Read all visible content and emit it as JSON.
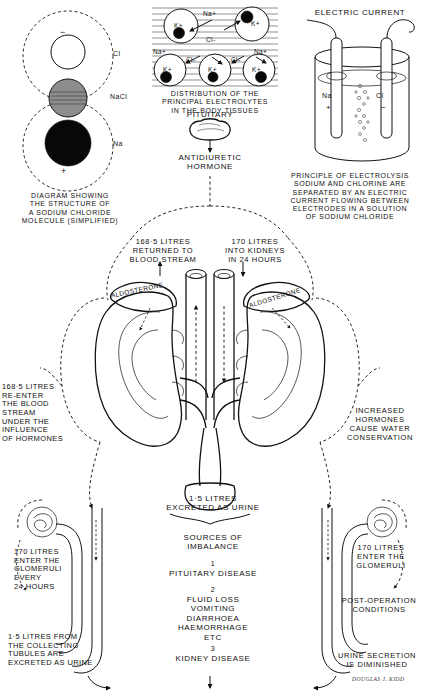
{
  "panels": {
    "molecule": {
      "title": "DIAGRAM SHOWING\nTHE STRUCTURE OF\nA SODIUM CHLORIDE\nMOLECULE (SIMPLIFIED)",
      "minus_sign": "−",
      "plus_sign": "+",
      "label_cl": "Cl",
      "label_nacl": "NaCl",
      "label_na": "Na"
    },
    "electrolytes": {
      "title": "DISTRIBUTION OF THE\nPRINCIPAL ELECTROLYTES\nIN THE BODY TISSUES",
      "ions": {
        "potassium": "K+",
        "sodium": "Na+",
        "chloride": "Cl-"
      },
      "cell_labels": [
        "K+",
        "K+",
        "K+",
        "K+",
        "K+"
      ],
      "free_sodium": [
        "Na+",
        "Na+",
        "Na+"
      ],
      "free_chloride": [
        "Cl-",
        "Cl-",
        "Cl-"
      ]
    },
    "electrolysis": {
      "heading": "ELECTRIC CURRENT",
      "anode_label": "Na",
      "anode_sign": "+",
      "cathode_label": "Cl",
      "cathode_sign": "−",
      "caption": "PRINCIPLE OF ELECTROLYSIS\nSODIUM AND CHLORINE ARE\nSEPARATED BY AN ELECTRIC\nCURRENT FLOWING BETWEEN\nELECTRODES IN A SOLUTION\nOF SODIUM CHLORIDE"
    }
  },
  "pituitary": {
    "gland_label": "PITUITARY",
    "hormone_label": "ANTIDIURETIC\nHORMONE"
  },
  "kidneys": {
    "returned_label": "168·5 LITRES\nRETURNED TO\nBLOOD STREAM",
    "intake_label": "170 LITRES\nINTO KIDNEYS\nIN 24 HOURS",
    "adrenal_left": "ALDOSTERONE",
    "adrenal_right": "ALDOSTERONE",
    "left_note": "168·5 LITRES\nRE-ENTER\nTHE BLOOD\nSTREAM\nUNDER THE\nINFLUENCE\nOF HORMONES",
    "right_note": "INCREASED\nHORMONES\nCAUSE WATER\nCONSERVATION",
    "urine_output": "1·5 LITRES\nEXCRETED AS URINE"
  },
  "imbalance": {
    "heading": "SOURCES OF\nIMBALANCE",
    "items": [
      {
        "number": "1",
        "text": "PITUITARY DISEASE"
      },
      {
        "number": "2",
        "text": "FLUID LOSS\nVOMITING\nDIARRHOEA\nHAEMORRHAGE\nETC"
      },
      {
        "number": "3",
        "text": "KIDNEY DISEASE"
      }
    ]
  },
  "nephrons": {
    "left_top": "170 LITRES\nENTER THE\nGLOMERULI\nEVERY\n24 HOURS",
    "left_bottom": "1·5 LITRES FROM\nTHE COLLECTING\nTUBULES ARE\nEXCRETED AS URINE",
    "right_top": "170 LITRES\nENTER THE\nGLOMERULI",
    "right_mid": "POST-OPERATION\nCONDITIONS",
    "right_bottom": "URINE SECRETION\nIS DIMINISHED"
  },
  "credit": {
    "signature": "DOUGLAS J. KIDD"
  },
  "colors": {
    "ink": "#111111",
    "paper": "#ffffff",
    "grey_fill": "#8d8d8d"
  }
}
